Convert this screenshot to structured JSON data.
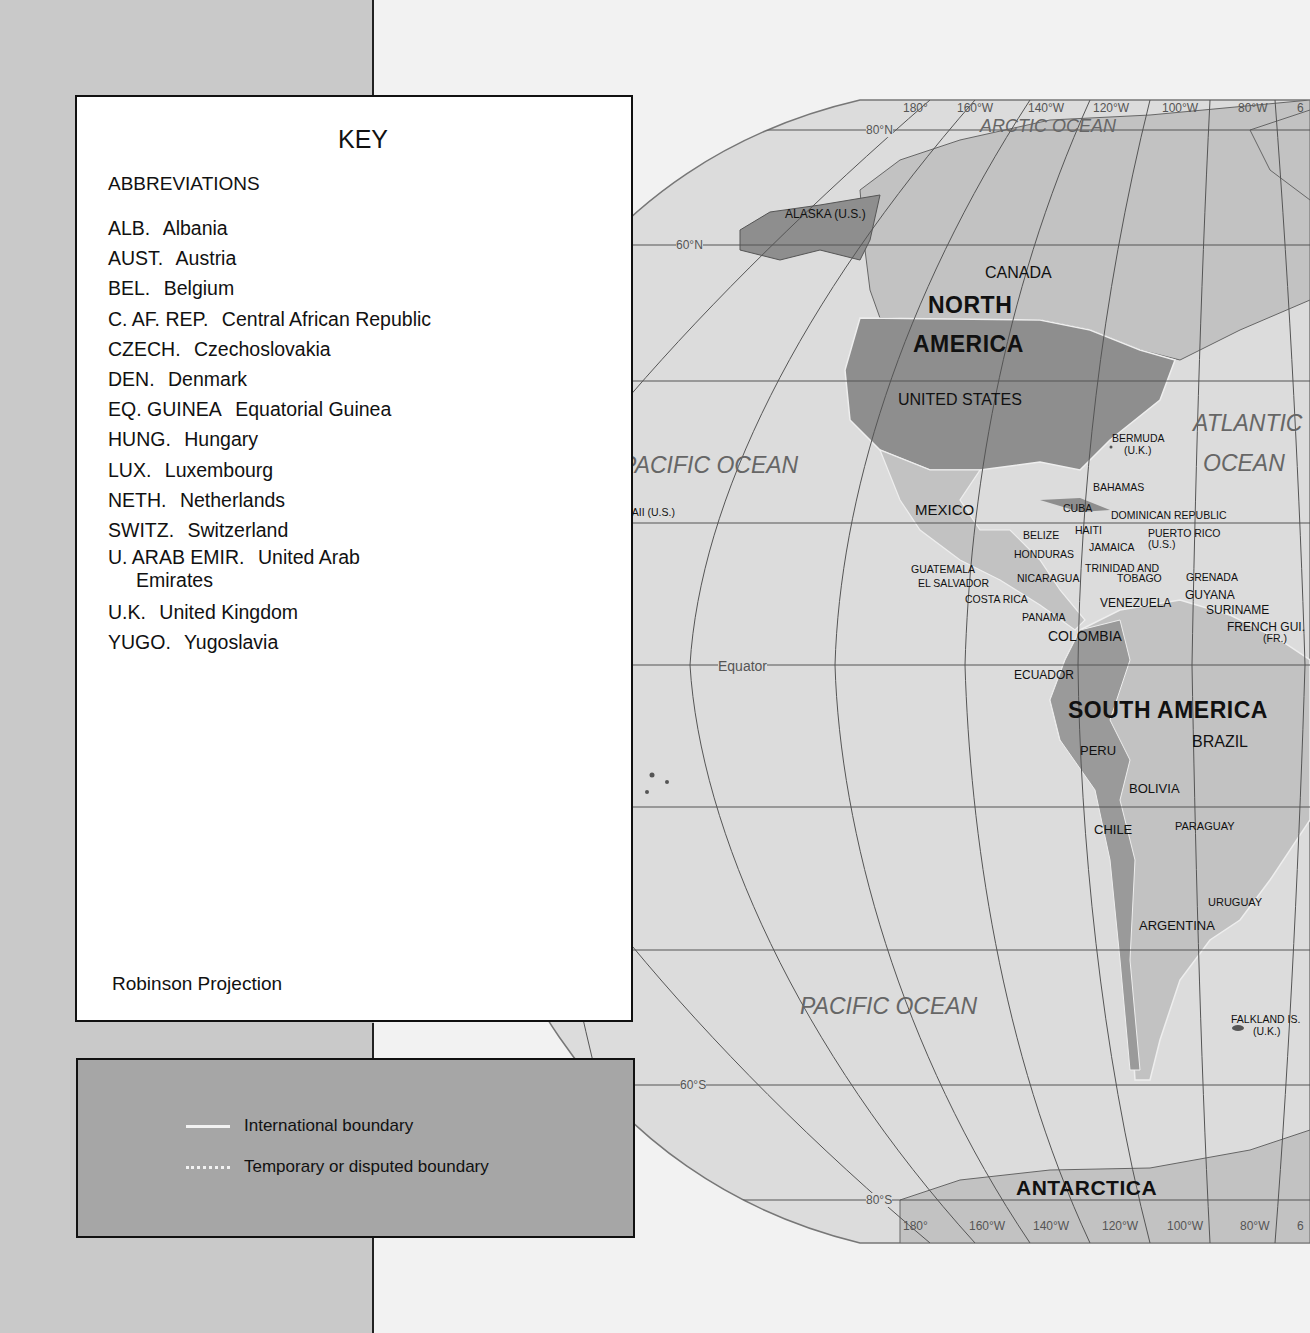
{
  "key": {
    "title": "KEY",
    "abbreviations_heading": "ABBREVIATIONS",
    "abbreviations": [
      {
        "code": "ALB.",
        "name": "Albania"
      },
      {
        "code": "AUST.",
        "name": "Austria"
      },
      {
        "code": "BEL.",
        "name": "Belgium"
      },
      {
        "code": "C. AF. REP.",
        "name": "Central African Republic"
      },
      {
        "code": "CZECH.",
        "name": "Czechoslovakia"
      },
      {
        "code": "DEN.",
        "name": "Denmark"
      },
      {
        "code": "EQ. GUINEA",
        "name": "Equatorial Guinea"
      },
      {
        "code": "HUNG.",
        "name": "Hungary"
      },
      {
        "code": "LUX.",
        "name": "Luxembourg"
      },
      {
        "code": "NETH.",
        "name": "Netherlands"
      },
      {
        "code": "SWITZ.",
        "name": "Switzerland"
      },
      {
        "code": "U. ARAB EMIR.",
        "name": "United Arab",
        "name_cont": "Emirates"
      },
      {
        "code": "U.K.",
        "name": "United Kingdom"
      },
      {
        "code": "YUGO.",
        "name": "Yugoslavia"
      }
    ],
    "projection": "Robinson Projection"
  },
  "legend": {
    "items": [
      {
        "style": "solid",
        "label": "International boundary",
        "color": "#f2f2f2"
      },
      {
        "style": "dotted",
        "label": "Temporary or disputed boundary",
        "color": "#f2f2f2"
      }
    ],
    "background": "#a6a6a6"
  },
  "map": {
    "graticule": {
      "longitudes_top": [
        "180°",
        "160°W",
        "140°W",
        "120°W",
        "100°W",
        "80°W",
        "6"
      ],
      "longitudes_bottom": [
        "180°",
        "160°W",
        "140°W",
        "120°W",
        "100°W",
        "80°W",
        "6"
      ],
      "latitudes": [
        "80°N",
        "60°N",
        "40°N",
        "20°N",
        "0°",
        "20°S",
        "40°S",
        "60°S",
        "80°S"
      ],
      "equator_label": "Equator"
    },
    "oceans": {
      "arctic": "ARCTIC OCEAN",
      "pacific_north": "PACIFIC OCEAN",
      "pacific_south": "PACIFIC OCEAN",
      "atlantic_1": "ATLANTIC",
      "atlantic_2": "OCEAN"
    },
    "continents": {
      "north_america_1": "NORTH",
      "north_america_2": "AMERICA",
      "south_america": "SOUTH AMERICA",
      "antarctica": "ANTARCTICA"
    },
    "countries": {
      "alaska": "ALASKA (U.S.)",
      "canada": "CANADA",
      "united_states": "UNITED STATES",
      "mexico": "MEXICO",
      "bermuda": "BERMUDA",
      "bermuda_uk": "(U.K.)",
      "bahamas": "BAHAMAS",
      "cuba": "CUBA",
      "dominican_republic": "DOMINICAN REPUBLIC",
      "haiti": "HAITI",
      "puerto_rico": "PUERTO RICO",
      "puerto_rico_us": "(U.S.)",
      "jamaica": "JAMAICA",
      "belize": "BELIZE",
      "honduras": "HONDURAS",
      "guatemala": "GUATEMALA",
      "el_salvador": "EL SALVADOR",
      "nicaragua": "NICARAGUA",
      "costa_rica": "COSTA RICA",
      "panama": "PANAMA",
      "trinidad_1": "TRINIDAD AND",
      "trinidad_2": "TOBAGO",
      "grenada": "GRENADA",
      "guyana": "GUYANA",
      "suriname": "SURINAME",
      "french_guiana": "FRENCH GUI.",
      "french_guiana_fr": "(FR.)",
      "venezuela": "VENEZUELA",
      "colombia": "COLOMBIA",
      "ecuador": "ECUADOR",
      "peru": "PERU",
      "brazil": "BRAZIL",
      "bolivia": "BOLIVIA",
      "chile": "CHILE",
      "paraguay": "PARAGUAY",
      "uruguay": "URUGUAY",
      "argentina": "ARGENTINA",
      "falkland": "FALKLAND IS.",
      "falkland_uk": "(U.K.)",
      "hawaii": "HAWAII (U.S.)",
      "kiribati": "KIRIBATI",
      "western_samoa_1": "WESTERN",
      "western_samoa_2": "SAMOA",
      "tonga": "TONGA"
    },
    "colors": {
      "ocean": "#dcdcdc",
      "land_light": "#bdbdbd",
      "land_mid": "#a8a8a8",
      "land_dark": "#8e8e8e",
      "grid": "#555555"
    }
  }
}
